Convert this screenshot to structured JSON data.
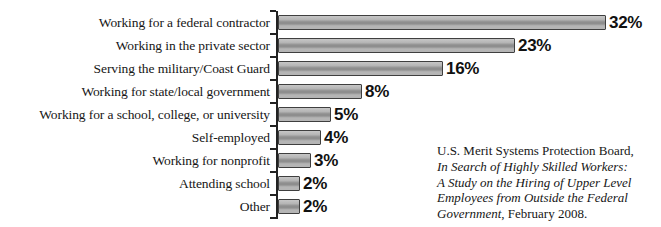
{
  "chart_data": {
    "type": "bar",
    "orientation": "horizontal",
    "title": "",
    "xlabel": "",
    "ylabel": "",
    "grid": false,
    "legend": "none",
    "xlim": [
      0,
      33
    ],
    "categories": [
      "Working for a federal contractor",
      "Working in the private sector",
      "Serving the military/Coast Guard",
      "Working for state/local government",
      "Working for a school, college, or university",
      "Self-employed",
      "Working for nonprofit",
      "Attending school",
      "Other"
    ],
    "values": [
      32,
      23,
      16,
      8,
      5,
      4,
      3,
      2,
      2
    ],
    "value_labels": [
      "32%",
      "23%",
      "16%",
      "8%",
      "5%",
      "4%",
      "3%",
      "2%",
      "2%"
    ]
  },
  "source_note": {
    "lines": [
      {
        "italic": "",
        "roman": "U.S. Merit Systems Protection Board,"
      },
      {
        "italic": "In Search of Highly Skilled Workers:",
        "roman": ""
      },
      {
        "italic": "A Study on the Hiring of Upper Level",
        "roman": ""
      },
      {
        "italic": "Employees from Outside the Federal",
        "roman": ""
      },
      {
        "italic": "Government",
        "roman": ", February 2008."
      }
    ]
  },
  "colors": {
    "text": "#161616",
    "axis": "#222222",
    "bar_border": "#3f3f3f",
    "bar_fill": "#b5b5b5",
    "bar_fill_hi": "#c7c7c7",
    "bar_fill_mid": "#8e8e8e"
  }
}
